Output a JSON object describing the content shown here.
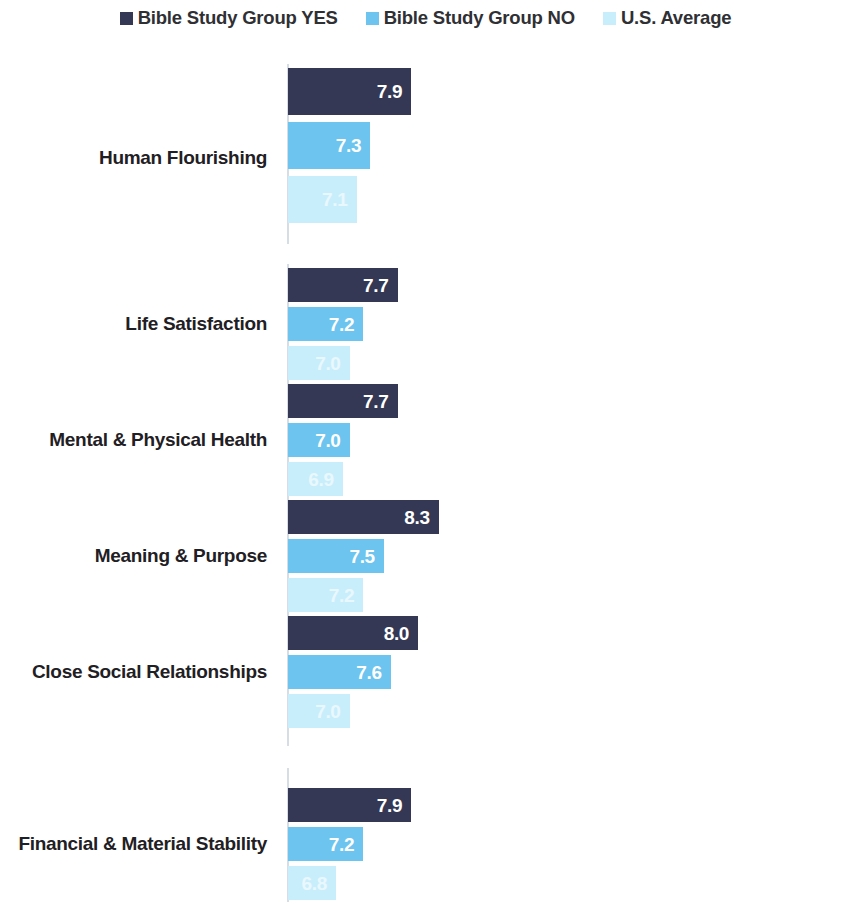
{
  "legend": {
    "items": [
      {
        "label": "Bible Study Group YES",
        "color": "#343854",
        "swatch_name": "legend-swatch-yes"
      },
      {
        "label": "Bible Study Group NO",
        "color": "#6cc4ef",
        "swatch_name": "legend-swatch-no"
      },
      {
        "label": "U.S. Average",
        "color": "#c9eefb",
        "swatch_name": "legend-swatch-us-average"
      }
    ]
  },
  "chart_data": {
    "type": "bar",
    "orientation": "horizontal",
    "title": "",
    "xlabel": "",
    "ylabel": "",
    "grid": false,
    "legend_position": "top-center",
    "axis_visible": true,
    "value_labels_inside_bars": true,
    "xlim": [
      0,
      10
    ],
    "categories": [
      "Human Flourishing",
      "Life Satisfaction",
      "Mental & Physical Health",
      "Meaning & Purpose",
      "Close Social Relationships",
      "Financial & Material Stability"
    ],
    "series": [
      {
        "name": "Bible Study Group YES",
        "color": "#343854",
        "values": [
          7.9,
          7.7,
          7.7,
          8.3,
          8.0,
          7.9
        ],
        "labels": [
          "7.9",
          "7.7",
          "7.7",
          "8.3",
          "8.0",
          "7.9"
        ]
      },
      {
        "name": "Bible Study Group NO",
        "color": "#6cc4ef",
        "values": [
          7.3,
          7.2,
          7.0,
          7.5,
          7.6,
          7.2
        ],
        "labels": [
          "7.3",
          "7.2",
          "7.0",
          "7.5",
          "7.6",
          "7.2"
        ]
      },
      {
        "name": "U.S. Average",
        "color": "#c9eefb",
        "values": [
          7.1,
          7.0,
          6.9,
          7.2,
          7.0,
          6.8
        ],
        "labels": [
          "7.1",
          "7.0",
          "6.9",
          "7.2",
          "7.0",
          "6.8"
        ]
      }
    ]
  },
  "layout": {
    "groups": [
      {
        "top": 24,
        "barHeight": 47,
        "barGap": 7,
        "labelY": 104,
        "axisTop": 20,
        "axisHeight": 180
      },
      {
        "top": 224,
        "barHeight": 34,
        "barGap": 5,
        "labelY": 270,
        "axisTop": 220,
        "axisHeight": 132
      },
      {
        "top": 340,
        "barHeight": 34,
        "barGap": 5,
        "labelY": 386,
        "axisTop": 336,
        "axisHeight": 132
      },
      {
        "top": 456,
        "barHeight": 34,
        "barGap": 5,
        "labelY": 502,
        "axisTop": 452,
        "axisHeight": 132
      },
      {
        "top": 572,
        "barHeight": 34,
        "barGap": 5,
        "labelY": 618,
        "axisTop": 568,
        "axisHeight": 134
      },
      {
        "top": 744,
        "barHeight": 34,
        "barGap": 5,
        "labelY": 790,
        "axisTop": 724,
        "axisHeight": 134
      }
    ],
    "axis_x": 287,
    "bar_origin_x": 288,
    "px_per_unit": 68.5,
    "value_offset": 6.1
  }
}
